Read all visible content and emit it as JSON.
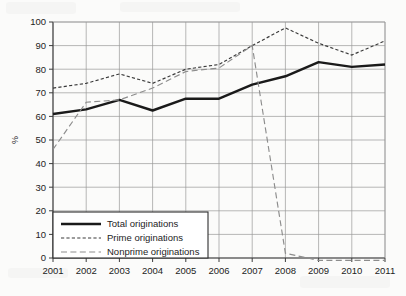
{
  "chart_data": {
    "type": "line",
    "title": "",
    "xlabel": "",
    "ylabel": "%",
    "categories": [
      "2001",
      "2002",
      "2003",
      "2004",
      "2005",
      "2006",
      "2007",
      "2008",
      "2009",
      "2010",
      "2011"
    ],
    "x": [
      2001,
      2002,
      2003,
      2004,
      2005,
      2006,
      2007,
      2008,
      2009,
      2010,
      2011
    ],
    "xlim": [
      2001,
      2011
    ],
    "ylim": [
      0,
      100
    ],
    "yticks": [
      0,
      10,
      20,
      30,
      40,
      50,
      60,
      70,
      80,
      90,
      100
    ],
    "ytick_labels": [
      "0",
      "10",
      "20",
      "30",
      "40",
      "50",
      "60",
      "70",
      "80",
      "90",
      "100"
    ],
    "xtick_labels": [
      "2001",
      "2002",
      "2003",
      "2004",
      "2005",
      "2006",
      "2007",
      "2008",
      "2009",
      "2010",
      "2011"
    ],
    "grid": true,
    "legend_position": "bottom-left",
    "series": [
      {
        "name": "Total originations",
        "style": "solid",
        "color": "#1a1a1a",
        "values": [
          61,
          63,
          67,
          62.5,
          67.5,
          67.5,
          73.5,
          77,
          83,
          81,
          82
        ]
      },
      {
        "name": "Prime originations",
        "style": "dotted-dash",
        "color": "#3a3a3a",
        "values": [
          72,
          74,
          78,
          74,
          80,
          82,
          90,
          97.5,
          91,
          86,
          92
        ]
      },
      {
        "name": "Nonprime originations",
        "style": "dashed",
        "color": "#8d8d8d",
        "values": [
          46,
          66,
          67,
          72,
          79,
          80.5,
          90,
          2,
          -1,
          -1,
          -1
        ]
      }
    ]
  },
  "legend": {
    "items": [
      {
        "label": "Total originations",
        "key": "total"
      },
      {
        "label": "Prime originations",
        "key": "prime"
      },
      {
        "label": "Nonprime originations",
        "key": "nonprime"
      }
    ]
  },
  "axis": {
    "y_title": "%"
  },
  "colors": {
    "background": "#fbfbfa",
    "grid": "#9a9a9a",
    "axis": "#3d3d3d",
    "total": "#1a1a1a",
    "prime": "#3a3a3a",
    "nonprime": "#8d8d8d"
  }
}
